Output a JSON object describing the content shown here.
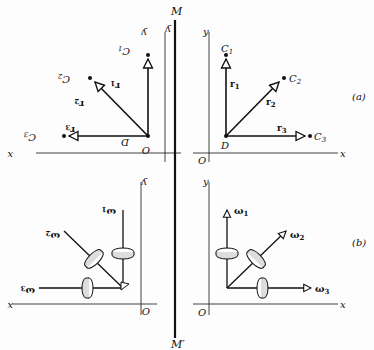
{
  "figure": {
    "mirror": {
      "top_label": "M",
      "bottom_label": "M′"
    },
    "panel_a": {
      "label": "(a)",
      "axis_x": "x",
      "axis_y": "y",
      "origin": "O",
      "base_point": "D",
      "vectors": [
        {
          "name": "r",
          "sub": "1",
          "endpoint": "C",
          "endpoint_sub": "1"
        },
        {
          "name": "r",
          "sub": "2",
          "endpoint": "C",
          "endpoint_sub": "2"
        },
        {
          "name": "r",
          "sub": "3",
          "endpoint": "C",
          "endpoint_sub": "3"
        }
      ]
    },
    "panel_b": {
      "label": "(b)",
      "axis_x": "x",
      "axis_y": "y",
      "origin": "O",
      "vectors": [
        {
          "name": "ω",
          "sub": "1"
        },
        {
          "name": "ω",
          "sub": "2"
        },
        {
          "name": "ω",
          "sub": "3"
        }
      ]
    },
    "colors": {
      "ink": "#111111",
      "background": "#fdfdfd"
    }
  }
}
